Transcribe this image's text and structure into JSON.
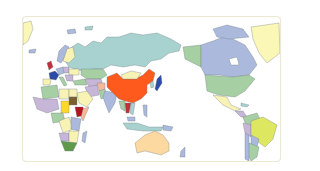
{
  "map": {
    "projection": "pacific-centered world map",
    "highlighted_country": "China",
    "colors": {
      "highlight": "#ff5a1e",
      "russia": "#a8d2cf",
      "canada": "#aab9dc",
      "usa": "#a6cfa3",
      "greenland": "#fbf7b6",
      "australia": "#fbd9a0",
      "brazil": "#dde860",
      "mongolia": "#f8f2b4",
      "south_africa": "#5e9a4a",
      "ethiopia": "#b3131c",
      "sudan": "#7a6030",
      "chad": "#ffd82a",
      "france": "#2c4aa8",
      "uk": "#c0303a"
    }
  }
}
